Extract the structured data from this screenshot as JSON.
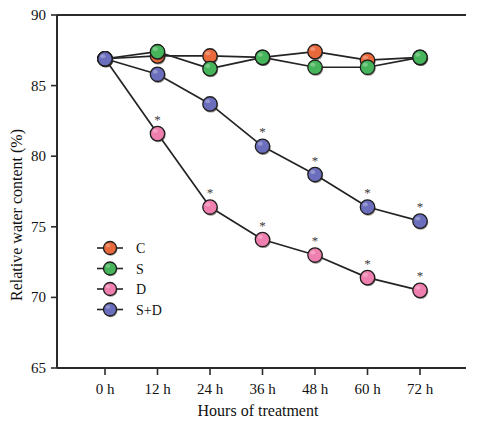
{
  "chart_data": {
    "type": "line",
    "title": "",
    "xlabel": "Hours of treatment",
    "ylabel": "Relative water content (%)",
    "categories": [
      "0 h",
      "12 h",
      "24 h",
      "36 h",
      "48 h",
      "60 h",
      "72 h"
    ],
    "ylim": [
      65,
      90
    ],
    "yticks": [
      65,
      70,
      75,
      80,
      85,
      90
    ],
    "grid": false,
    "legend_position": "inner-left",
    "annotation_symbol": "*",
    "annotation_meaning": "significant difference",
    "series": [
      {
        "name": "C",
        "color": "#e8693c",
        "values": [
          86.9,
          87.1,
          87.1,
          87.0,
          87.4,
          86.8,
          87.0
        ],
        "starred": [
          false,
          false,
          false,
          false,
          false,
          false,
          false
        ]
      },
      {
        "name": "S",
        "color": "#46b45a",
        "values": [
          86.9,
          87.4,
          86.2,
          87.0,
          86.3,
          86.3,
          87.0
        ],
        "starred": [
          false,
          false,
          false,
          false,
          false,
          false,
          false
        ]
      },
      {
        "name": "D",
        "color": "#ef7fae",
        "values": [
          86.9,
          81.6,
          76.4,
          74.1,
          73.0,
          71.4,
          70.5
        ],
        "starred": [
          false,
          true,
          true,
          true,
          true,
          true,
          true
        ]
      },
      {
        "name": "S+D",
        "color": "#6b6ebc",
        "values": [
          86.9,
          85.8,
          83.7,
          80.7,
          78.7,
          76.4,
          75.4
        ],
        "starred": [
          false,
          false,
          false,
          true,
          true,
          true,
          true
        ]
      }
    ]
  },
  "legend": {
    "items": [
      {
        "label": "C",
        "color": "#e8693c"
      },
      {
        "label": "S",
        "color": "#46b45a"
      },
      {
        "label": "D",
        "color": "#ef7fae"
      },
      {
        "label": "S+D",
        "color": "#6b6ebc"
      }
    ]
  },
  "axes": {
    "y_tick_labels": [
      "90",
      "85",
      "80",
      "75",
      "70",
      "65"
    ],
    "x_tick_labels": [
      "0 h",
      "12 h",
      "24 h",
      "36 h",
      "48 h",
      "60 h",
      "72 h"
    ],
    "y_axis_title": "Relative water content (%)",
    "x_axis_title": "Hours of treatment"
  }
}
